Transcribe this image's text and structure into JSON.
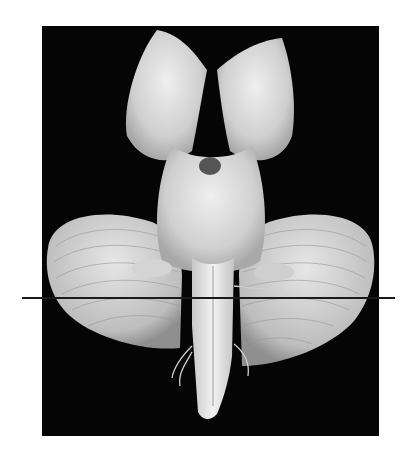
{
  "figure": {
    "background_color": "#050505",
    "page_color": "#ffffff",
    "specimen_color": "#d9d9d9",
    "line_color": "#1a1a1a",
    "annotation": "horizontal section line"
  }
}
